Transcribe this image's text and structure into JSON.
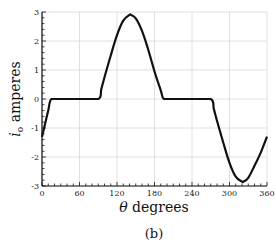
{
  "chart_data": {
    "type": "line",
    "title": "",
    "caption": "(b)",
    "xlabel": "θ degrees",
    "ylabel_symbol": "i",
    "ylabel_subscript": "o",
    "ylabel_unit": "amperes",
    "xlim": [
      0,
      360
    ],
    "ylim": [
      -3,
      3
    ],
    "xticks": [
      0,
      60,
      120,
      180,
      240,
      300,
      360
    ],
    "yticks": [
      -3,
      -2,
      -1,
      0,
      1,
      2,
      3
    ],
    "grid": true,
    "legend": null,
    "series": [
      {
        "name": "i_o",
        "color": "#111111",
        "x": [
          0,
          5,
          10,
          15,
          30,
          60,
          90,
          95,
          100,
          110,
          120,
          130,
          140,
          142,
          150,
          160,
          170,
          180,
          190,
          195,
          210,
          240,
          270,
          275,
          280,
          290,
          300,
          310,
          320,
          322,
          330,
          340,
          350,
          360
        ],
        "y": [
          -1.3,
          -0.85,
          -0.4,
          0,
          0,
          0,
          0,
          0.35,
          0.75,
          1.5,
          2.2,
          2.7,
          2.9,
          2.9,
          2.78,
          2.35,
          1.7,
          0.95,
          0.3,
          0,
          0,
          0,
          0,
          -0.35,
          -0.75,
          -1.5,
          -2.2,
          -2.68,
          -2.85,
          -2.85,
          -2.72,
          -2.3,
          -1.85,
          -1.3
        ]
      }
    ]
  }
}
